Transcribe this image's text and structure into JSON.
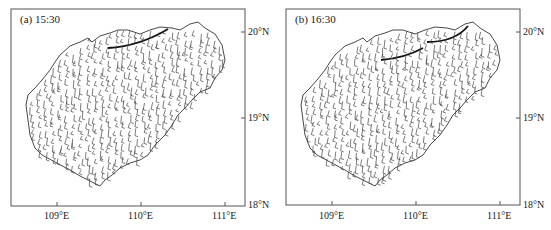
{
  "figure": {
    "panels": [
      {
        "id": "a",
        "title": "(a) 15:30",
        "x_ticks": [
          "109°E",
          "110°E",
          "111°E"
        ],
        "y_ticks": [
          "20°N",
          "19°N",
          "18°N"
        ]
      },
      {
        "id": "b",
        "title": "(b) 16:30",
        "x_ticks": [
          "109°E",
          "110°E",
          "111°E"
        ],
        "y_ticks": [
          "20°N",
          "19°N",
          "18°N"
        ]
      }
    ],
    "colors": {
      "outline": "#333333",
      "barbs": "#444444",
      "front": "#111111",
      "frame": "#555555"
    }
  }
}
